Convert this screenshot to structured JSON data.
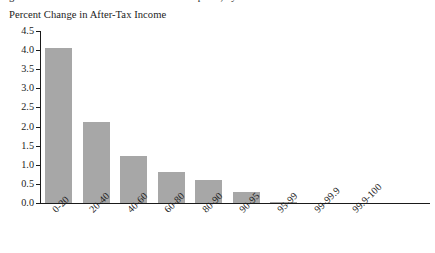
{
  "top_cutoff_text": "Figure 2. Distributional Effects of the Tax Proposal, by Income Percentile",
  "chart_data": {
    "type": "bar",
    "title": "Percent Change in After-Tax Income",
    "xlabel": "",
    "ylabel": "",
    "grid": false,
    "legend": "none",
    "ylim": [
      0.0,
      4.5
    ],
    "ytick_labels": [
      "4.5",
      "4.0",
      "3.5",
      "3.0",
      "2.5",
      "2.0",
      "1.5",
      "1.0",
      "0.5",
      "0.0"
    ],
    "ytick_values": [
      4.5,
      4.0,
      3.5,
      3.0,
      2.5,
      2.0,
      1.5,
      1.0,
      0.5,
      0.0
    ],
    "categories": [
      "0-20",
      "20-40",
      "40-60",
      "60-80",
      "80-90",
      "90-95",
      "95-99",
      "99-99.9",
      "99.9-100"
    ],
    "values": [
      4.05,
      2.12,
      1.24,
      0.8,
      0.6,
      0.28,
      0.03,
      0.0,
      0.0
    ],
    "bar_color": "#a7a7a7",
    "axis_color": "#1a1a1a"
  }
}
